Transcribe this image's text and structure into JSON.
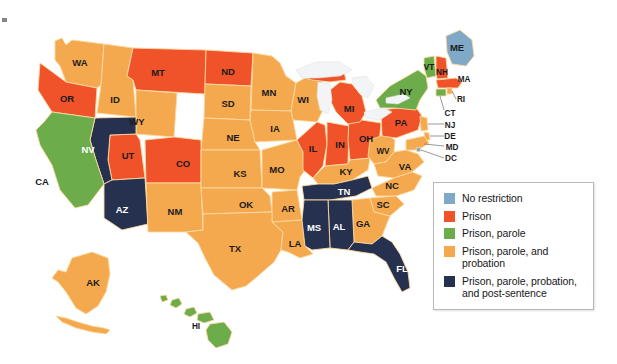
{
  "figure": {
    "background_color": "#ffffff"
  },
  "palette": {
    "no_restriction": "#7fa9c6",
    "prison": "#f0532a",
    "prison_parole": "#6cac4a",
    "prison_parole_probation": "#f5a94e",
    "prison_parole_probation_post": "#26304f",
    "state_border": "#fbd9a2",
    "lake": "#f2f4f5",
    "label_dark": "#1b1b1b",
    "legend_border": "#b9b9b9"
  },
  "legend": {
    "items": [
      {
        "label": "No restriction",
        "color_key": "no_restriction",
        "color": "#7fa9c6"
      },
      {
        "label": "Prison",
        "color_key": "prison",
        "color": "#f0532a"
      },
      {
        "label": "Prison, parole",
        "color_key": "prison_parole",
        "color": "#6cac4a"
      },
      {
        "label": "Prison, parole, and probation",
        "color_key": "prison_parole_probation",
        "color": "#f5a94e"
      },
      {
        "label": "Prison, parole, probation, and post-sentence",
        "color_key": "prison_parole_probation_post",
        "color": "#26304f"
      }
    ]
  },
  "map": {
    "states": [
      {
        "code": "WA",
        "category": "prison_parole_probation",
        "color": "#f5a94e",
        "label_x": 80,
        "label_y": 63
      },
      {
        "code": "OR",
        "category": "prison",
        "color": "#f0532a",
        "label_x": 67,
        "label_y": 99
      },
      {
        "code": "ID",
        "category": "prison_parole_probation",
        "color": "#f5a94e",
        "label_x": 115,
        "label_y": 100
      },
      {
        "code": "MT",
        "category": "prison",
        "color": "#f0532a",
        "label_x": 158,
        "label_y": 73
      },
      {
        "code": "ND",
        "category": "prison",
        "color": "#f0532a",
        "label_x": 228,
        "label_y": 72
      },
      {
        "code": "SD",
        "category": "prison_parole_probation",
        "color": "#f5a94e",
        "label_x": 228,
        "label_y": 104
      },
      {
        "code": "MN",
        "category": "prison_parole_probation",
        "color": "#f5a94e",
        "label_x": 269,
        "label_y": 93
      },
      {
        "code": "WI",
        "category": "prison_parole_probation",
        "color": "#f5a94e",
        "label_x": 303,
        "label_y": 100
      },
      {
        "code": "WY",
        "category": "prison_parole_probation",
        "color": "#f5a94e",
        "label_x": 137,
        "label_y": 122
      },
      {
        "code": "NV",
        "category": "prison_parole_probation_post",
        "color": "#26304f",
        "label_x": 88,
        "label_y": 150
      },
      {
        "code": "UT",
        "category": "prison",
        "color": "#f0532a",
        "label_x": 128,
        "label_y": 156
      },
      {
        "code": "CO",
        "category": "prison",
        "color": "#f0532a",
        "label_x": 183,
        "label_y": 164
      },
      {
        "code": "NE",
        "category": "prison_parole_probation",
        "color": "#f5a94e",
        "label_x": 233,
        "label_y": 138
      },
      {
        "code": "IA",
        "category": "prison_parole_probation",
        "color": "#f5a94e",
        "label_x": 275,
        "label_y": 129
      },
      {
        "code": "CA",
        "category": "prison_parole",
        "color": "#6cac4a",
        "label_x": 42,
        "label_y": 182
      },
      {
        "code": "AZ",
        "category": "prison_parole_probation_post",
        "color": "#26304f",
        "label_x": 122,
        "label_y": 210
      },
      {
        "code": "NM",
        "category": "prison_parole_probation",
        "color": "#f5a94e",
        "label_x": 175,
        "label_y": 212
      },
      {
        "code": "KS",
        "category": "prison_parole_probation",
        "color": "#f5a94e",
        "label_x": 240,
        "label_y": 174
      },
      {
        "code": "MO",
        "category": "prison_parole_probation",
        "color": "#f5a94e",
        "label_x": 277,
        "label_y": 170
      },
      {
        "code": "IL",
        "category": "prison",
        "color": "#f0532a",
        "label_x": 313,
        "label_y": 149
      },
      {
        "code": "IN",
        "category": "prison",
        "color": "#f0532a",
        "label_x": 340,
        "label_y": 145
      },
      {
        "code": "OH",
        "category": "prison",
        "color": "#f0532a",
        "label_x": 366,
        "label_y": 139
      },
      {
        "code": "MI",
        "category": "prison",
        "color": "#f0532a",
        "label_x": 349,
        "label_y": 109
      },
      {
        "code": "KY",
        "category": "prison_parole_probation",
        "color": "#f5a94e",
        "label_x": 346,
        "label_y": 172
      },
      {
        "code": "WV",
        "category": "prison_parole_probation",
        "color": "#f5a94e",
        "label_x": 383,
        "label_y": 152
      },
      {
        "code": "VA",
        "category": "prison_parole_probation",
        "color": "#f5a94e",
        "label_x": 405,
        "label_y": 167
      },
      {
        "code": "PA",
        "category": "prison",
        "color": "#f0532a",
        "label_x": 401,
        "label_y": 123
      },
      {
        "code": "NY",
        "category": "prison_parole",
        "color": "#6cac4a",
        "label_x": 406,
        "label_y": 92
      },
      {
        "code": "VT",
        "category": "prison_parole",
        "color": "#6cac4a",
        "label_x": 429,
        "label_y": 68
      },
      {
        "code": "NH",
        "category": "prison",
        "color": "#f0532a",
        "label_x": 442,
        "label_y": 73
      },
      {
        "code": "ME",
        "category": "no_restriction",
        "color": "#7fa9c6",
        "label_x": 457,
        "label_y": 48
      },
      {
        "code": "MA",
        "category": "prison",
        "color": "#f0532a",
        "label_x": 464,
        "label_y": 80
      },
      {
        "code": "TN",
        "category": "prison_parole_probation_post",
        "color": "#26304f",
        "label_x": 344,
        "label_y": 192
      },
      {
        "code": "NC",
        "category": "prison_parole_probation",
        "color": "#f5a94e",
        "label_x": 392,
        "label_y": 186
      },
      {
        "code": "SC",
        "category": "prison_parole_probation",
        "color": "#f5a94e",
        "label_x": 383,
        "label_y": 205
      },
      {
        "code": "GA",
        "category": "prison_parole_probation",
        "color": "#f5a94e",
        "label_x": 363,
        "label_y": 224
      },
      {
        "code": "AL",
        "category": "prison_parole_probation_post",
        "color": "#26304f",
        "label_x": 339,
        "label_y": 227
      },
      {
        "code": "MS",
        "category": "prison_parole_probation_post",
        "color": "#26304f",
        "label_x": 314,
        "label_y": 228
      },
      {
        "code": "AR",
        "category": "prison_parole_probation",
        "color": "#f5a94e",
        "label_x": 288,
        "label_y": 209
      },
      {
        "code": "LA",
        "category": "prison_parole_probation",
        "color": "#f5a94e",
        "label_x": 295,
        "label_y": 244
      },
      {
        "code": "OK",
        "category": "prison_parole_probation",
        "color": "#f5a94e",
        "label_x": 246,
        "label_y": 205
      },
      {
        "code": "TX",
        "category": "prison_parole_probation",
        "color": "#f5a94e",
        "label_x": 235,
        "label_y": 249
      },
      {
        "code": "FL",
        "category": "prison_parole_probation_post",
        "color": "#26304f",
        "label_x": 402,
        "label_y": 269
      },
      {
        "code": "AK",
        "category": "prison_parole_probation",
        "color": "#f5a94e",
        "label_x": 93,
        "label_y": 283
      },
      {
        "code": "HI",
        "category": "prison_parole",
        "color": "#6cac4a",
        "label_x": 196,
        "label_y": 327
      }
    ],
    "callout_states": [
      {
        "code": "RI",
        "category": "prison_parole_probation",
        "color": "#f5a94e",
        "label_x": 461,
        "label_y": 100
      },
      {
        "code": "CT",
        "category": "prison_parole",
        "color": "#6cac4a",
        "label_x": 450,
        "label_y": 114
      },
      {
        "code": "NJ",
        "category": "prison_parole_probation",
        "color": "#f5a94e",
        "label_x": 450,
        "label_y": 126
      },
      {
        "code": "DE",
        "category": "prison_parole_probation",
        "color": "#f5a94e",
        "label_x": 450,
        "label_y": 137
      },
      {
        "code": "MD",
        "category": "prison_parole_probation",
        "color": "#f5a94e",
        "label_x": 452,
        "label_y": 148
      },
      {
        "code": "DC",
        "category": "no_restriction",
        "color": "#7fa9c6",
        "label_x": 451,
        "label_y": 159
      }
    ]
  }
}
